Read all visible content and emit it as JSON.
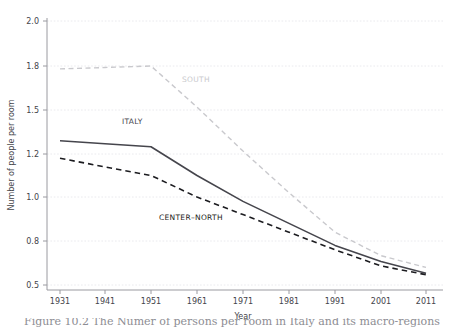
{
  "chart_data": {
    "type": "line",
    "title": "",
    "xlabel": "Year",
    "ylabel": "Number of people per room",
    "x": [
      1931,
      1941,
      1951,
      1961,
      1971,
      1981,
      1991,
      2001,
      2011
    ],
    "xtick_labels": [
      "1931",
      "1941",
      "1951",
      "1961",
      "1971",
      "1981",
      "1991",
      "2001",
      "2011"
    ],
    "ytick_labels": [
      "2.0",
      "1.8",
      "1.5",
      "1.2",
      "1.0",
      "0.8",
      "0.5"
    ],
    "ytick_values": [
      2.0,
      1.8,
      1.5,
      1.2,
      1.0,
      0.8,
      0.5
    ],
    "ylim": [
      0.5,
      2.0
    ],
    "xlim": [
      1931,
      2011
    ],
    "grid": "horizontal-dotted",
    "legend": "inline-labels",
    "series": [
      {
        "name": "SOUTH",
        "label": "SOUTH",
        "style": "dashed",
        "color": "#c9c9cd",
        "values": [
          1.78,
          1.79,
          1.8,
          1.52,
          1.22,
          1.02,
          0.84,
          0.7,
          0.62
        ]
      },
      {
        "name": "ITALY",
        "label": "ITALY",
        "style": "solid",
        "color": "#45454c",
        "values": [
          1.29,
          1.27,
          1.25,
          1.1,
          0.98,
          0.88,
          0.77,
          0.66,
          0.58
        ]
      },
      {
        "name": "CENTER-NORTH",
        "label": "CENTER–NORTH",
        "style": "dashed",
        "color": "#1c1c20",
        "values": [
          1.18,
          1.14,
          1.1,
          1.0,
          0.92,
          0.84,
          0.74,
          0.63,
          0.57
        ]
      }
    ],
    "annotations": [
      {
        "text": "SOUTH",
        "x": 1961,
        "y": 1.68,
        "color": "#c9c9cd"
      },
      {
        "text": "ITALY",
        "x": 1946,
        "y": 1.4,
        "color": "#45454c"
      },
      {
        "text": "CENTER–NORTH",
        "x": 1964,
        "y": 0.9,
        "color": "#1c1c20"
      }
    ]
  },
  "caption": {
    "text": "Figure 10.2  The Numer of persons per room in Italy and its macro-regions"
  }
}
